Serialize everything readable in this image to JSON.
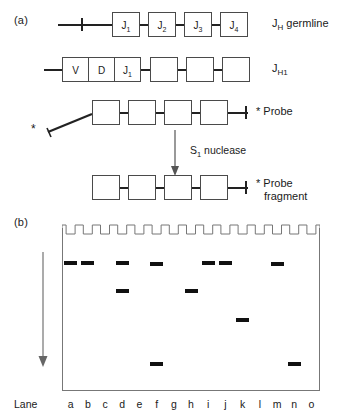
{
  "figure": {
    "panel_a_label": "(a)",
    "panel_b_label": "(b)",
    "process_label": "S1 nuclease",
    "process_label_base": "S",
    "process_label_sub": "1",
    "process_label_rest": " nuclease"
  },
  "panel_a": {
    "rows": [
      {
        "id": "jh-germline",
        "label_main": "J",
        "label_sub": "H",
        "label_rest": " germline",
        "segments": [
          "J1",
          "J2",
          "J3",
          "J4"
        ],
        "segment_labels": [
          {
            "base": "J",
            "sub": "1"
          },
          {
            "base": "J",
            "sub": "2"
          },
          {
            "base": "J",
            "sub": "3"
          },
          {
            "base": "J",
            "sub": "4"
          }
        ],
        "has_left_tick": true,
        "has_right_tick": true,
        "starred": false
      },
      {
        "id": "jh1-rearranged",
        "label_main": "J",
        "label_sub": "H1",
        "label_rest": "",
        "segment_labels": [
          {
            "base": "V",
            "sub": ""
          },
          {
            "base": "D",
            "sub": ""
          },
          {
            "base": "J",
            "sub": "1"
          },
          {
            "base": "",
            "sub": ""
          },
          {
            "base": "",
            "sub": ""
          },
          {
            "base": "",
            "sub": ""
          }
        ],
        "has_left_tick": false,
        "has_right_tick": true,
        "starred": false
      },
      {
        "id": "probe",
        "label_main": "Probe",
        "label_sub": "",
        "label_rest": "",
        "segment_labels": [
          {
            "base": "",
            "sub": ""
          },
          {
            "base": "",
            "sub": ""
          },
          {
            "base": "",
            "sub": ""
          },
          {
            "base": "",
            "sub": ""
          }
        ],
        "star_mark": "*",
        "starred": true
      },
      {
        "id": "probe-fragment",
        "label_main": "Probe",
        "label_line2": "fragment",
        "label_sub": "",
        "label_rest": "",
        "segment_labels": [
          {
            "base": "",
            "sub": ""
          },
          {
            "base": "",
            "sub": ""
          },
          {
            "base": "",
            "sub": ""
          },
          {
            "base": "",
            "sub": ""
          }
        ],
        "star_mark": "*",
        "starred": true
      }
    ]
  },
  "panel_b": {
    "lane_caption": "Lane",
    "lanes": [
      "a",
      "b",
      "c",
      "d",
      "e",
      "f",
      "g",
      "h",
      "i",
      "j",
      "k",
      "l",
      "m",
      "n",
      "o"
    ],
    "well_count": 15,
    "migration_direction": "down",
    "bands": [
      {
        "lane": "a",
        "y": 261
      },
      {
        "lane": "b",
        "y": 261
      },
      {
        "lane": "d",
        "y": 261
      },
      {
        "lane": "f",
        "y": 262
      },
      {
        "lane": "i",
        "y": 261
      },
      {
        "lane": "j",
        "y": 261
      },
      {
        "lane": "m",
        "y": 262
      },
      {
        "lane": "d",
        "y": 289
      },
      {
        "lane": "h",
        "y": 289
      },
      {
        "lane": "k",
        "y": 318
      },
      {
        "lane": "f",
        "y": 362
      },
      {
        "lane": "n",
        "y": 362
      }
    ]
  },
  "colors": {
    "ink": "#111111",
    "line": "#222222",
    "box_border": "#4a4a4a",
    "gel_border": "#777777",
    "background": "#ffffff"
  }
}
